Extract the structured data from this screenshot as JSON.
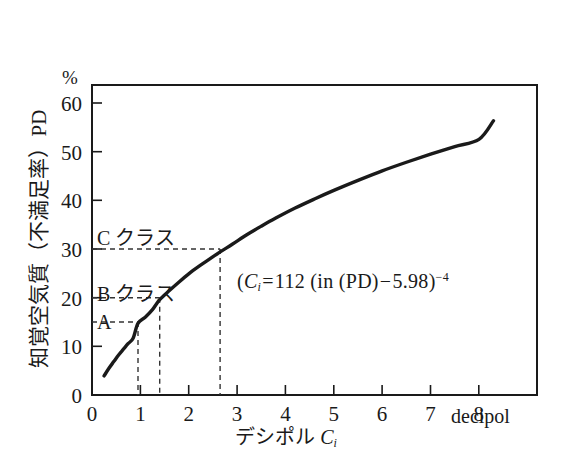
{
  "figure": {
    "percent_unit": "%",
    "y_axis_title": "知覚空気質（不満足率）PD",
    "x_axis_title_text": "デシポル ",
    "x_axis_title_var": "C",
    "x_axis_title_sub": "i",
    "x_unit_label": "decipol"
  },
  "annotations": {
    "class_c": "C クラス",
    "class_b": "B クラス",
    "class_a": "A",
    "formula": {
      "open": "(",
      "var": "C",
      "sub": "i",
      "eq": "=",
      "coefficient": "112",
      "inner_open": "(in (PD)",
      "minus": "−",
      "constant": "5.98",
      "close": ")",
      "exponent": "−4",
      "plain": "(Ci=112 (in (PD)−5.98)−4"
    }
  },
  "chart_data": {
    "type": "line",
    "title": "",
    "xlabel": "デシポル Ci",
    "ylabel": "知覚空気質（不満足率）PD",
    "xunit": "decipol",
    "yunit": "%",
    "xlim": [
      0,
      9.2
    ],
    "ylim": [
      0,
      65
    ],
    "xticks": [
      0,
      1,
      2,
      3,
      4,
      5,
      6,
      7,
      8
    ],
    "yticks": [
      0,
      10,
      20,
      30,
      40,
      50,
      60
    ],
    "grid": false,
    "legend": null,
    "equation": "Ci = 112 (ln(PD) − 5.98)^−4",
    "series": [
      {
        "name": "PD vs decipol",
        "x": [
          0.25,
          0.35,
          0.45,
          0.55,
          0.65,
          0.75,
          0.85,
          0.95,
          1.1,
          1.25,
          1.4,
          1.6,
          1.8,
          2.0,
          2.2,
          2.4,
          2.65,
          2.9,
          3.2,
          3.5,
          3.8,
          4.2,
          4.6,
          5.0,
          5.5,
          6.0,
          6.5,
          7.0,
          7.5,
          8.0,
          8.3
        ],
        "y": [
          4.0,
          5.6,
          7.0,
          8.4,
          9.6,
          10.8,
          11.9,
          15.0,
          16.3,
          17.9,
          20.0,
          21.9,
          23.7,
          25.4,
          26.9,
          28.3,
          30.0,
          31.6,
          33.6,
          35.4,
          37.1,
          39.2,
          41.1,
          42.9,
          45.0,
          47.0,
          48.8,
          50.5,
          52.1,
          53.6,
          57.5
        ]
      }
    ],
    "threshold_markers": [
      {
        "label": "A",
        "pd": 15,
        "decipol": 0.95
      },
      {
        "label": "B クラス",
        "pd": 20,
        "decipol": 1.4
      },
      {
        "label": "C クラス",
        "pd": 30,
        "decipol": 2.65
      }
    ]
  },
  "colors": {
    "curve": "#1a1a1a",
    "axis": "#1a1a1a",
    "dashed": "#333333",
    "background": "#ffffff"
  }
}
